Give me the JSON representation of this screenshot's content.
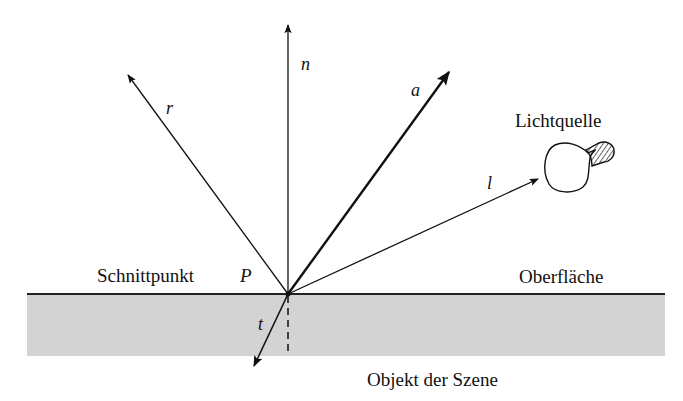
{
  "diagram": {
    "type": "ray-tracing-vectors",
    "vectors": [
      {
        "id": "n",
        "label": "n",
        "meaning": "normal"
      },
      {
        "id": "r",
        "label": "r",
        "meaning": "reflection"
      },
      {
        "id": "a",
        "label": "a",
        "meaning": "view / incoming ray"
      },
      {
        "id": "l",
        "label": "l",
        "meaning": "light direction"
      },
      {
        "id": "t",
        "label": "t",
        "meaning": "transmission"
      }
    ],
    "labels": {
      "intersection": "Schnittpunkt",
      "point": "P",
      "light_source": "Lichtquelle",
      "surface": "Oberfläche",
      "object": "Objekt der Szene"
    },
    "colors": {
      "object_fill": "#d3d3d3",
      "line": "#111111"
    }
  }
}
